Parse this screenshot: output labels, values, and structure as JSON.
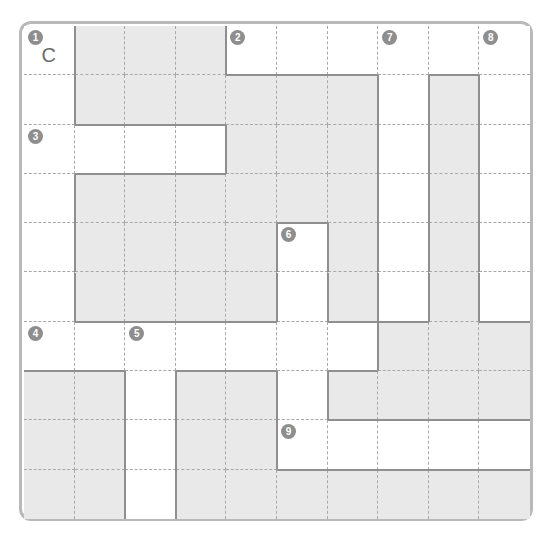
{
  "puzzle": {
    "rows": 10,
    "cols": 10,
    "colors": {
      "block": "#e9e9e9",
      "white": "#ffffff",
      "number_badge": "#8e8e8e",
      "frame": "#b9b9b9",
      "grid_dash": "#a9a9a9",
      "word_outline": "#8f8f8f"
    },
    "layout": [
      "WBBBWWWWWW",
      "WBBBBBBWBW",
      "WWWWBBBWBW",
      "WBBBBBBWBW",
      "WBBBBWBWBW",
      "WBBBBWBWBW",
      "WWWWWWWBBB",
      "BBWBBWBBBB",
      "BBWBBWWWWW",
      "BBWBBBBBBB"
    ],
    "numbers": [
      {
        "label": "1",
        "row": 0,
        "col": 0
      },
      {
        "label": "2",
        "row": 0,
        "col": 4
      },
      {
        "label": "7",
        "row": 0,
        "col": 7
      },
      {
        "label": "8",
        "row": 0,
        "col": 9
      },
      {
        "label": "3",
        "row": 2,
        "col": 0
      },
      {
        "label": "6",
        "row": 4,
        "col": 5
      },
      {
        "label": "4",
        "row": 6,
        "col": 0
      },
      {
        "label": "5",
        "row": 6,
        "col": 2
      },
      {
        "label": "9",
        "row": 8,
        "col": 5
      }
    ],
    "letters": [
      {
        "value": "C",
        "row": 0,
        "col": 0
      }
    ],
    "words": [
      {
        "number": "1",
        "direction": "down",
        "row": 0,
        "col": 0,
        "length": 7
      },
      {
        "number": "2",
        "direction": "across",
        "row": 0,
        "col": 4,
        "length": 6
      },
      {
        "number": "3",
        "direction": "across",
        "row": 2,
        "col": 0,
        "length": 4
      },
      {
        "number": "4",
        "direction": "across",
        "row": 6,
        "col": 0,
        "length": 7
      },
      {
        "number": "5",
        "direction": "down",
        "row": 6,
        "col": 2,
        "length": 4
      },
      {
        "number": "6",
        "direction": "down",
        "row": 4,
        "col": 5,
        "length": 5
      },
      {
        "number": "7",
        "direction": "down",
        "row": 0,
        "col": 7,
        "length": 6
      },
      {
        "number": "8",
        "direction": "down",
        "row": 0,
        "col": 9,
        "length": 6
      },
      {
        "number": "9",
        "direction": "across",
        "row": 8,
        "col": 5,
        "length": 5
      }
    ]
  }
}
